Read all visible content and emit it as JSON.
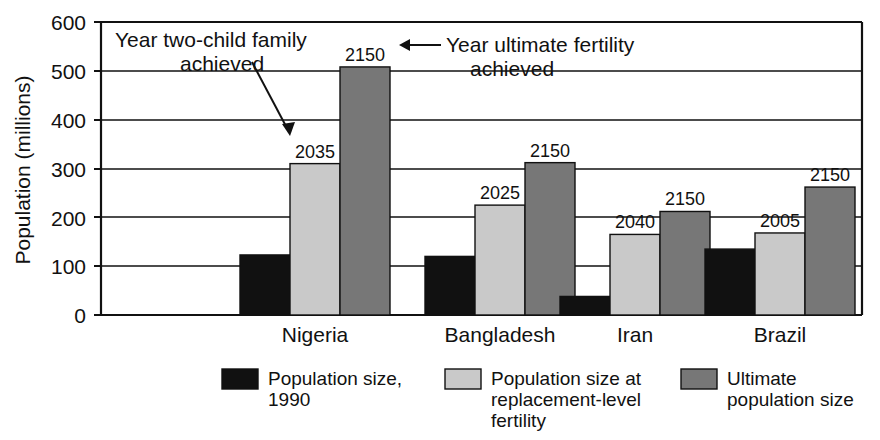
{
  "chart_data": {
    "type": "bar",
    "title": "",
    "xlabel": "",
    "ylabel": "Population (millions)",
    "ylim": [
      0,
      600
    ],
    "ytick_values": [
      0,
      100,
      200,
      300,
      400,
      500,
      600
    ],
    "ytick_labels": [
      "0",
      "100",
      "200",
      "300",
      "400",
      "500",
      "600"
    ],
    "grid": "horizontal",
    "legend_position": "bottom",
    "categories": [
      "Nigeria",
      "Bangladesh",
      "Iran",
      "Brazil"
    ],
    "series": [
      {
        "name": "Population size, 1990",
        "color": "#111111",
        "values": [
          123,
          120,
          38,
          135
        ],
        "point_labels": [
          "",
          "",
          "",
          ""
        ]
      },
      {
        "name": "Population size at replacement-level fertility",
        "color": "#c9c9c9",
        "values": [
          310,
          225,
          165,
          168
        ],
        "point_labels": [
          "2035",
          "2025",
          "2040",
          "2005"
        ]
      },
      {
        "name": "Ultimate population size",
        "color": "#777777",
        "values": [
          508,
          312,
          212,
          262
        ],
        "point_labels": [
          "2150",
          "2150",
          "2150",
          "2150"
        ]
      }
    ],
    "annotations": [
      {
        "id": "two-child-annotation",
        "line1": "Year two-child family",
        "line2": "achieved",
        "arrow": "down-right"
      },
      {
        "id": "ultimate-fertility-annotation",
        "line1": "Year ultimate fertility",
        "line2": "achieved",
        "arrow": "left"
      }
    ]
  },
  "legend": {
    "items": [
      {
        "swatch_color": "#111111",
        "line1": "Population size,",
        "line2": "1990",
        "line3": ""
      },
      {
        "swatch_color": "#c9c9c9",
        "line1": "Population size at",
        "line2": "replacement-level",
        "line3": "fertility"
      },
      {
        "swatch_color": "#777777",
        "line1": "Ultimate",
        "line2": "population size",
        "line3": ""
      }
    ]
  }
}
